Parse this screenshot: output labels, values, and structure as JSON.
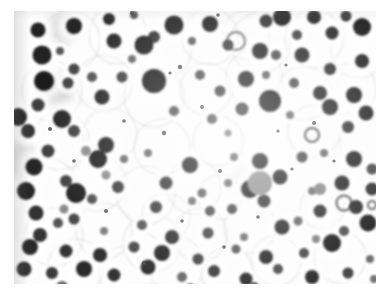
{
  "image": {
    "title": "Grayscale light micrograph of cell suspension",
    "modality": "brightfield-microscopy",
    "specimen": "cells with dark stained nuclei and pale cytoplasm halos",
    "canvas": {
      "width": 388,
      "height": 295
    },
    "frame": {
      "x": 14,
      "y": 11,
      "width": 362,
      "height": 273
    },
    "colors": {
      "page_background": "#ffffff",
      "field_background": "#fdfdfd",
      "frame_border": "#8d8d8d",
      "nucleus_dark": "#1c1c1c",
      "nucleus_mid": "#4a4a4a",
      "nucleus_light": "#8e8e8e",
      "membrane_outline": "#bdbdbd",
      "halo": "#ffffff"
    },
    "rendering": {
      "blur_px": 1.1,
      "membrane_stroke_opacity": 0.38,
      "halo_opacity": 0.9
    },
    "membranes": [
      {
        "cx": 56,
        "cy": 30,
        "r": 30
      },
      {
        "cx": 104,
        "cy": 24,
        "r": 29
      },
      {
        "cx": 150,
        "cy": 40,
        "r": 27
      },
      {
        "cx": 196,
        "cy": 26,
        "r": 28
      },
      {
        "cx": 246,
        "cy": 32,
        "r": 30
      },
      {
        "cx": 300,
        "cy": 28,
        "r": 29
      },
      {
        "cx": 344,
        "cy": 40,
        "r": 27
      },
      {
        "cx": 680,
        "cy": 70,
        "r": 26
      },
      {
        "cx": 38,
        "cy": 80,
        "r": 30
      },
      {
        "cx": 90,
        "cy": 72,
        "r": 28
      },
      {
        "cx": 140,
        "cy": 86,
        "r": 30
      },
      {
        "cx": 192,
        "cy": 78,
        "r": 26
      },
      {
        "cx": 240,
        "cy": 66,
        "r": 28
      },
      {
        "cx": 290,
        "cy": 82,
        "r": 27
      },
      {
        "cx": 336,
        "cy": 78,
        "r": 26
      },
      {
        "cx": 232,
        "cy": 24,
        "r": 24
      },
      {
        "cx": 46,
        "cy": 130,
        "r": 29
      },
      {
        "cx": 96,
        "cy": 124,
        "r": 27
      },
      {
        "cx": 148,
        "cy": 136,
        "r": 28
      },
      {
        "cx": 204,
        "cy": 130,
        "r": 25
      },
      {
        "cx": 300,
        "cy": 120,
        "r": 26
      },
      {
        "cx": 350,
        "cy": 132,
        "r": 24
      },
      {
        "cx": 34,
        "cy": 178,
        "r": 30
      },
      {
        "cx": 84,
        "cy": 172,
        "r": 28
      },
      {
        "cx": 132,
        "cy": 184,
        "r": 29
      },
      {
        "cx": 180,
        "cy": 176,
        "r": 27
      },
      {
        "cx": 40,
        "cy": 226,
        "r": 29
      },
      {
        "cx": 90,
        "cy": 220,
        "r": 28
      },
      {
        "cx": 138,
        "cy": 232,
        "r": 29
      },
      {
        "cx": 186,
        "cy": 224,
        "r": 27
      },
      {
        "cx": 236,
        "cy": 216,
        "r": 26
      },
      {
        "cx": 62,
        "cy": 256,
        "r": 28
      },
      {
        "cx": 112,
        "cy": 262,
        "r": 27
      },
      {
        "cx": 162,
        "cy": 254,
        "r": 28
      },
      {
        "cx": 214,
        "cy": 262,
        "r": 26
      },
      {
        "cx": 262,
        "cy": 250,
        "r": 25
      },
      {
        "cx": 152,
        "cy": 206,
        "r": 24
      },
      {
        "cx": 206,
        "cy": 186,
        "r": 22
      },
      {
        "cx": 326,
        "cy": 246,
        "r": 26
      },
      {
        "cx": 308,
        "cy": 196,
        "r": 22
      }
    ],
    "nuclei": [
      {
        "cx": 60,
        "cy": 15,
        "r": 8.0,
        "tone": 0.9
      },
      {
        "cx": 24,
        "cy": 19,
        "r": 7.5,
        "tone": 0.92
      },
      {
        "cx": 95,
        "cy": 8,
        "r": 6.0,
        "tone": 0.88
      },
      {
        "cx": 120,
        "cy": 4,
        "r": 4.0,
        "tone": 0.7
      },
      {
        "cx": 160,
        "cy": 14,
        "r": 9.5,
        "tone": 0.93
      },
      {
        "cx": 196,
        "cy": 13,
        "r": 8.0,
        "tone": 0.92
      },
      {
        "cx": 252,
        "cy": 10,
        "r": 6.5,
        "tone": 0.86
      },
      {
        "cx": 268,
        "cy": 6,
        "r": 9.0,
        "tone": 0.94
      },
      {
        "cx": 300,
        "cy": 6,
        "r": 7.0,
        "tone": 0.9
      },
      {
        "cx": 332,
        "cy": 5,
        "r": 5.5,
        "tone": 0.82
      },
      {
        "cx": 348,
        "cy": 16,
        "r": 9.0,
        "tone": 0.93
      },
      {
        "cx": 318,
        "cy": 22,
        "r": 6.5,
        "tone": 0.88
      },
      {
        "cx": 283,
        "cy": 24,
        "r": 5.0,
        "tone": 0.78
      },
      {
        "cx": 28,
        "cy": 44,
        "r": 9.5,
        "tone": 0.92
      },
      {
        "cx": 46,
        "cy": 40,
        "r": 4.0,
        "tone": 0.68
      },
      {
        "cx": 100,
        "cy": 30,
        "r": 7.5,
        "tone": 0.9
      },
      {
        "cx": 118,
        "cy": 48,
        "r": 4.0,
        "tone": 0.62
      },
      {
        "cx": 140,
        "cy": 26,
        "r": 6.0,
        "tone": 0.84
      },
      {
        "cx": 130,
        "cy": 34,
        "r": 9.5,
        "tone": 0.93
      },
      {
        "cx": 178,
        "cy": 30,
        "r": 4.0,
        "tone": 0.66
      },
      {
        "cx": 214,
        "cy": 34,
        "r": 5.5,
        "tone": 0.8
      },
      {
        "cx": 246,
        "cy": 40,
        "r": 8.0,
        "tone": 0.91
      },
      {
        "cx": 262,
        "cy": 44,
        "r": 5.0,
        "tone": 0.74
      },
      {
        "cx": 288,
        "cy": 44,
        "r": 7.5,
        "tone": 0.89
      },
      {
        "cx": 316,
        "cy": 58,
        "r": 6.0,
        "tone": 0.84
      },
      {
        "cx": 348,
        "cy": 50,
        "r": 7.0,
        "tone": 0.88
      },
      {
        "cx": 60,
        "cy": 58,
        "r": 5.5,
        "tone": 0.78
      },
      {
        "cx": 78,
        "cy": 66,
        "r": 5.0,
        "tone": 0.72
      },
      {
        "cx": 30,
        "cy": 70,
        "r": 10.0,
        "tone": 0.94
      },
      {
        "cx": 54,
        "cy": 72,
        "r": 5.5,
        "tone": 0.8
      },
      {
        "cx": 88,
        "cy": 86,
        "r": 7.5,
        "tone": 0.9
      },
      {
        "cx": 108,
        "cy": 66,
        "r": 5.5,
        "tone": 0.78
      },
      {
        "cx": 140,
        "cy": 70,
        "r": 12.0,
        "tone": 0.95
      },
      {
        "cx": 186,
        "cy": 64,
        "r": 5.0,
        "tone": 0.72
      },
      {
        "cx": 206,
        "cy": 80,
        "r": 5.5,
        "tone": 0.78
      },
      {
        "cx": 232,
        "cy": 68,
        "r": 8.0,
        "tone": 0.91
      },
      {
        "cx": 252,
        "cy": 64,
        "r": 4.0,
        "tone": 0.66
      },
      {
        "cx": 280,
        "cy": 72,
        "r": 5.0,
        "tone": 0.74
      },
      {
        "cx": 306,
        "cy": 82,
        "r": 7.0,
        "tone": 0.88
      },
      {
        "cx": 256,
        "cy": 90,
        "r": 11.0,
        "tone": 0.94
      },
      {
        "cx": 340,
        "cy": 84,
        "r": 8.0,
        "tone": 0.9
      },
      {
        "cx": 24,
        "cy": 94,
        "r": 6.5,
        "tone": 0.8
      },
      {
        "cx": 4,
        "cy": 106,
        "r": 9.0,
        "tone": 0.9
      },
      {
        "cx": 48,
        "cy": 108,
        "r": 9.0,
        "tone": 0.9
      },
      {
        "cx": 60,
        "cy": 120,
        "r": 6.0,
        "tone": 0.8
      },
      {
        "cx": 160,
        "cy": 100,
        "r": 5.0,
        "tone": 0.72
      },
      {
        "cx": 198,
        "cy": 108,
        "r": 5.0,
        "tone": 0.7
      },
      {
        "cx": 214,
        "cy": 122,
        "r": 3.5,
        "tone": 0.55
      },
      {
        "cx": 228,
        "cy": 98,
        "r": 6.5,
        "tone": 0.82
      },
      {
        "cx": 276,
        "cy": 104,
        "r": 4.0,
        "tone": 0.62
      },
      {
        "cx": 316,
        "cy": 96,
        "r": 8.0,
        "tone": 0.89
      },
      {
        "cx": 352,
        "cy": 102,
        "r": 7.5,
        "tone": 0.88
      },
      {
        "cx": 334,
        "cy": 116,
        "r": 6.0,
        "tone": 0.82
      },
      {
        "cx": 14,
        "cy": 120,
        "r": 7.0,
        "tone": 0.84
      },
      {
        "cx": 34,
        "cy": 140,
        "r": 6.5,
        "tone": 0.8
      },
      {
        "cx": 72,
        "cy": 140,
        "r": 5.0,
        "tone": 0.46
      },
      {
        "cx": 92,
        "cy": 134,
        "r": 8.0,
        "tone": 0.9
      },
      {
        "cx": 110,
        "cy": 148,
        "r": 4.0,
        "tone": 0.6
      },
      {
        "cx": 92,
        "cy": 164,
        "r": 4.5,
        "tone": 0.45
      },
      {
        "cx": 134,
        "cy": 142,
        "r": 4.0,
        "tone": 0.6
      },
      {
        "cx": 84,
        "cy": 148,
        "r": 9.0,
        "tone": 0.92
      },
      {
        "cx": 176,
        "cy": 154,
        "r": 8.0,
        "tone": 0.89
      },
      {
        "cx": 220,
        "cy": 146,
        "r": 4.0,
        "tone": 0.6
      },
      {
        "cx": 246,
        "cy": 150,
        "r": 8.0,
        "tone": 0.88
      },
      {
        "cx": 288,
        "cy": 146,
        "r": 5.5,
        "tone": 0.76
      },
      {
        "cx": 310,
        "cy": 142,
        "r": 4.0,
        "tone": 0.62
      },
      {
        "cx": 340,
        "cy": 148,
        "r": 8.0,
        "tone": 0.88
      },
      {
        "cx": 358,
        "cy": 158,
        "r": 5.5,
        "tone": 0.74
      },
      {
        "cx": 20,
        "cy": 156,
        "r": 8.5,
        "tone": 0.9
      },
      {
        "cx": 52,
        "cy": 170,
        "r": 6.0,
        "tone": 0.78
      },
      {
        "cx": 152,
        "cy": 172,
        "r": 6.5,
        "tone": 0.82
      },
      {
        "cx": 188,
        "cy": 182,
        "r": 4.5,
        "tone": 0.64
      },
      {
        "cx": 214,
        "cy": 172,
        "r": 4.0,
        "tone": 0.58
      },
      {
        "cx": 266,
        "cy": 166,
        "r": 7.5,
        "tone": 0.88
      },
      {
        "cx": 298,
        "cy": 180,
        "r": 4.0,
        "tone": 0.58
      },
      {
        "cx": 306,
        "cy": 178,
        "r": 6.0,
        "tone": 0.48
      },
      {
        "cx": 328,
        "cy": 172,
        "r": 7.5,
        "tone": 0.88
      },
      {
        "cx": 358,
        "cy": 178,
        "r": 6.5,
        "tone": 0.84
      },
      {
        "cx": 12,
        "cy": 180,
        "r": 9.0,
        "tone": 0.9
      },
      {
        "cx": 50,
        "cy": 198,
        "r": 4.5,
        "tone": 0.46
      },
      {
        "cx": 78,
        "cy": 188,
        "r": 5.0,
        "tone": 0.72
      },
      {
        "cx": 22,
        "cy": 202,
        "r": 7.5,
        "tone": 0.86
      },
      {
        "cx": 62,
        "cy": 182,
        "r": 10.0,
        "tone": 0.93
      },
      {
        "cx": 104,
        "cy": 176,
        "r": 6.0,
        "tone": 0.8
      },
      {
        "cx": 142,
        "cy": 196,
        "r": 6.0,
        "tone": 0.8
      },
      {
        "cx": 178,
        "cy": 190,
        "r": 4.0,
        "tone": 0.58
      },
      {
        "cx": 196,
        "cy": 200,
        "r": 5.0,
        "tone": 0.72
      },
      {
        "cx": 218,
        "cy": 198,
        "r": 5.0,
        "tone": 0.74
      },
      {
        "cx": 250,
        "cy": 190,
        "r": 6.5,
        "tone": 0.82
      },
      {
        "cx": 284,
        "cy": 210,
        "r": 4.5,
        "tone": 0.6
      },
      {
        "cx": 236,
        "cy": 178,
        "r": 9.0,
        "tone": 0.9
      },
      {
        "cx": 246,
        "cy": 172,
        "r": 12.0,
        "tone": 0.42
      },
      {
        "cx": 306,
        "cy": 200,
        "r": 6.5,
        "tone": 0.84
      },
      {
        "cx": 342,
        "cy": 196,
        "r": 7.0,
        "tone": 0.86
      },
      {
        "cx": 26,
        "cy": 224,
        "r": 7.0,
        "tone": 0.84
      },
      {
        "cx": 44,
        "cy": 212,
        "r": 5.0,
        "tone": 0.7
      },
      {
        "cx": 60,
        "cy": 208,
        "r": 5.5,
        "tone": 0.76
      },
      {
        "cx": 90,
        "cy": 220,
        "r": 4.0,
        "tone": 0.52
      },
      {
        "cx": 128,
        "cy": 214,
        "r": 5.0,
        "tone": 0.7
      },
      {
        "cx": 158,
        "cy": 226,
        "r": 7.0,
        "tone": 0.84
      },
      {
        "cx": 194,
        "cy": 222,
        "r": 5.5,
        "tone": 0.76
      },
      {
        "cx": 230,
        "cy": 226,
        "r": 4.0,
        "tone": 0.56
      },
      {
        "cx": 268,
        "cy": 216,
        "r": 7.5,
        "tone": 0.86
      },
      {
        "cx": 302,
        "cy": 228,
        "r": 4.0,
        "tone": 0.5
      },
      {
        "cx": 330,
        "cy": 220,
        "r": 5.0,
        "tone": 0.72
      },
      {
        "cx": 354,
        "cy": 212,
        "r": 8.5,
        "tone": 0.9
      },
      {
        "cx": 16,
        "cy": 236,
        "r": 8.0,
        "tone": 0.88
      },
      {
        "cx": 52,
        "cy": 240,
        "r": 6.5,
        "tone": 0.84
      },
      {
        "cx": 86,
        "cy": 244,
        "r": 7.0,
        "tone": 0.86
      },
      {
        "cx": 120,
        "cy": 236,
        "r": 5.5,
        "tone": 0.76
      },
      {
        "cx": 148,
        "cy": 242,
        "r": 8.0,
        "tone": 0.88
      },
      {
        "cx": 184,
        "cy": 248,
        "r": 5.5,
        "tone": 0.76
      },
      {
        "cx": 222,
        "cy": 238,
        "r": 4.5,
        "tone": 0.66
      },
      {
        "cx": 252,
        "cy": 246,
        "r": 7.0,
        "tone": 0.86
      },
      {
        "cx": 290,
        "cy": 242,
        "r": 5.0,
        "tone": 0.74
      },
      {
        "cx": 318,
        "cy": 232,
        "r": 9.0,
        "tone": 0.9
      },
      {
        "cx": 356,
        "cy": 248,
        "r": 4.0,
        "tone": 0.58
      },
      {
        "cx": 10,
        "cy": 258,
        "r": 7.5,
        "tone": 0.86
      },
      {
        "cx": 38,
        "cy": 262,
        "r": 6.0,
        "tone": 0.82
      },
      {
        "cx": 70,
        "cy": 258,
        "r": 8.0,
        "tone": 0.88
      },
      {
        "cx": 100,
        "cy": 264,
        "r": 6.5,
        "tone": 0.84
      },
      {
        "cx": 134,
        "cy": 256,
        "r": 7.5,
        "tone": 0.86
      },
      {
        "cx": 168,
        "cy": 266,
        "r": 5.0,
        "tone": 0.6
      },
      {
        "cx": 200,
        "cy": 260,
        "r": 6.0,
        "tone": 0.8
      },
      {
        "cx": 232,
        "cy": 268,
        "r": 6.5,
        "tone": 0.84
      },
      {
        "cx": 264,
        "cy": 258,
        "r": 5.0,
        "tone": 0.72
      },
      {
        "cx": 298,
        "cy": 266,
        "r": 7.0,
        "tone": 0.86
      },
      {
        "cx": 334,
        "cy": 262,
        "r": 5.5,
        "tone": 0.76
      },
      {
        "cx": 360,
        "cy": 268,
        "r": 4.0,
        "tone": 0.56
      },
      {
        "cx": 48,
        "cy": 276,
        "r": 6.0,
        "tone": 0.62
      },
      {
        "cx": 108,
        "cy": 280,
        "r": 5.0,
        "tone": 0.7
      },
      {
        "cx": 176,
        "cy": 278,
        "r": 5.5,
        "tone": 0.74
      },
      {
        "cx": 240,
        "cy": 276,
        "r": 5.0,
        "tone": 0.68
      },
      {
        "cx": 310,
        "cy": 280,
        "r": 4.5,
        "tone": 0.62
      }
    ],
    "pale_rings": [
      {
        "cx": 330,
        "cy": 192,
        "r": 7.5,
        "tone": 0.3
      },
      {
        "cx": 222,
        "cy": 30,
        "r": 9.0,
        "tone": 0.22
      },
      {
        "cx": 358,
        "cy": 194,
        "r": 4.0,
        "tone": 0.26
      },
      {
        "cx": 298,
        "cy": 124,
        "r": 7.0,
        "tone": 0.34
      }
    ],
    "smudges": [
      {
        "cx": 40,
        "cy": 80,
        "r": 18,
        "tone": 0.3
      },
      {
        "cx": 238,
        "cy": 172,
        "r": 17,
        "tone": 0.26
      },
      {
        "cx": 48,
        "cy": 18,
        "r": 16,
        "tone": 0.2
      },
      {
        "cx": 6,
        "cy": 150,
        "r": 20,
        "tone": 0.18
      }
    ],
    "specks": [
      {
        "cx": 118,
        "cy": 2,
        "r": 2.0
      },
      {
        "cx": 204,
        "cy": 4,
        "r": 1.8
      },
      {
        "cx": 166,
        "cy": 56,
        "r": 2.2
      },
      {
        "cx": 272,
        "cy": 54,
        "r": 1.6
      },
      {
        "cx": 188,
        "cy": 96,
        "r": 2.0
      },
      {
        "cx": 110,
        "cy": 110,
        "r": 1.8
      },
      {
        "cx": 150,
        "cy": 122,
        "r": 2.2
      },
      {
        "cx": 264,
        "cy": 120,
        "r": 1.6
      },
      {
        "cx": 300,
        "cy": 112,
        "r": 2.0
      },
      {
        "cx": 60,
        "cy": 150,
        "r": 1.8
      },
      {
        "cx": 206,
        "cy": 160,
        "r": 2.0
      },
      {
        "cx": 168,
        "cy": 210,
        "r": 1.8
      },
      {
        "cx": 278,
        "cy": 158,
        "r": 1.6
      },
      {
        "cx": 130,
        "cy": 252,
        "r": 2.0
      },
      {
        "cx": 210,
        "cy": 236,
        "r": 1.8
      },
      {
        "cx": 92,
        "cy": 200,
        "r": 2.0
      },
      {
        "cx": 320,
        "cy": 150,
        "r": 1.6
      },
      {
        "cx": 244,
        "cy": 206,
        "r": 1.8
      },
      {
        "cx": 36,
        "cy": 118,
        "r": 2.0
      },
      {
        "cx": 156,
        "cy": 62,
        "r": 1.6
      }
    ]
  }
}
